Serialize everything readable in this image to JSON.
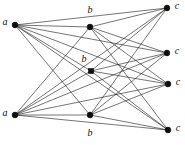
{
  "figure": {
    "width": 185,
    "height": 145,
    "background_color": "#ffffff",
    "edge_color": "#1a1a1a",
    "vertex_color": "#0d0d0d",
    "label_color": "#111111"
  },
  "chart_data": {
    "type": "diagram",
    "diagram_type": "graph",
    "title": "",
    "xlabel": "",
    "ylabel": "",
    "grid": false,
    "legend": null,
    "parts": [
      {
        "name": "a",
        "count": 2
      },
      {
        "name": "b",
        "count": 3
      },
      {
        "name": "c",
        "count": 4
      }
    ],
    "nodes": [
      {
        "id": "a1",
        "label": "a",
        "x": 15,
        "y": 25,
        "part": "a",
        "shape": "circle",
        "label_x": 5,
        "label_y": 23
      },
      {
        "id": "a2",
        "label": "a",
        "x": 15,
        "y": 115,
        "part": "a",
        "shape": "circle",
        "label_x": 5,
        "label_y": 114
      },
      {
        "id": "b1",
        "label": "b",
        "x": 90,
        "y": 27,
        "part": "b",
        "shape": "circle",
        "label_x": 90,
        "label_y": 11
      },
      {
        "id": "b2",
        "label": "b",
        "x": 91,
        "y": 71,
        "part": "b",
        "shape": "square",
        "label_x": 84,
        "label_y": 60
      },
      {
        "id": "b3",
        "label": "b",
        "x": 90,
        "y": 115,
        "part": "b",
        "shape": "circle",
        "label_x": 90,
        "label_y": 134
      },
      {
        "id": "c1",
        "label": "c",
        "x": 167,
        "y": 8,
        "part": "c",
        "shape": "circle",
        "label_x": 177,
        "label_y": 7
      },
      {
        "id": "c2",
        "label": "c",
        "x": 167,
        "y": 53,
        "part": "c",
        "shape": "circle",
        "label_x": 177,
        "label_y": 52
      },
      {
        "id": "c3",
        "label": "c",
        "x": 168,
        "y": 84,
        "part": "c",
        "shape": "circle",
        "label_x": 178,
        "label_y": 83
      },
      {
        "id": "c4",
        "label": "c",
        "x": 168,
        "y": 130,
        "part": "c",
        "shape": "circle",
        "label_x": 178,
        "label_y": 129
      }
    ],
    "edges": [
      [
        "a1",
        "b1"
      ],
      [
        "a1",
        "b2"
      ],
      [
        "a1",
        "b3"
      ],
      [
        "a1",
        "c1"
      ],
      [
        "a1",
        "c2"
      ],
      [
        "a1",
        "c3"
      ],
      [
        "a1",
        "c4"
      ],
      [
        "a2",
        "b1"
      ],
      [
        "a2",
        "b2"
      ],
      [
        "a2",
        "b3"
      ],
      [
        "a2",
        "c1"
      ],
      [
        "a2",
        "c2"
      ],
      [
        "a2",
        "c3"
      ],
      [
        "a2",
        "c4"
      ],
      [
        "b1",
        "c1"
      ],
      [
        "b1",
        "c2"
      ],
      [
        "b1",
        "c3"
      ],
      [
        "b1",
        "c4"
      ],
      [
        "b2",
        "c1"
      ],
      [
        "b2",
        "c2"
      ],
      [
        "b2",
        "c3"
      ],
      [
        "b2",
        "c4"
      ],
      [
        "b3",
        "c1"
      ],
      [
        "b3",
        "c2"
      ],
      [
        "b3",
        "c3"
      ],
      [
        "b3",
        "c4"
      ]
    ],
    "edge_count": 26,
    "node_count": 9
  }
}
